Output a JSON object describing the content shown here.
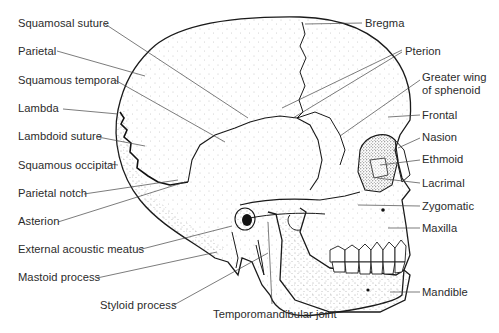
{
  "diagram": {
    "colors": {
      "ink": "#1a1a1a",
      "text": "#2b2b2b",
      "leader": "#444444",
      "background": "#ffffff"
    },
    "labels_left": [
      {
        "id": "squamosal-suture",
        "text": "Squamosal suture",
        "x": 18,
        "y": 17
      },
      {
        "id": "parietal",
        "text": "Parietal",
        "x": 18,
        "y": 45
      },
      {
        "id": "squamous-temporal",
        "text": "Squamous temporal",
        "x": 18,
        "y": 74
      },
      {
        "id": "lambda",
        "text": "Lambda",
        "x": 18,
        "y": 102
      },
      {
        "id": "lambdoid-suture",
        "text": "Lambdoid suture",
        "x": 18,
        "y": 130
      },
      {
        "id": "squamous-occipital",
        "text": "Squamous occipital",
        "x": 18,
        "y": 159
      },
      {
        "id": "parietal-notch",
        "text": "Parietal notch",
        "x": 18,
        "y": 187
      },
      {
        "id": "asterion",
        "text": "Asterion",
        "x": 18,
        "y": 215
      },
      {
        "id": "external-acoustic-meatus",
        "text": "External acoustic meatus",
        "x": 18,
        "y": 243
      },
      {
        "id": "mastoid-process",
        "text": "Mastoid process",
        "x": 18,
        "y": 271
      },
      {
        "id": "styloid-process",
        "text": "Styloid process",
        "x": 100,
        "y": 299
      }
    ],
    "labels_bottom": [
      {
        "id": "temporomandibular-joint",
        "text": "Temporomandibular joint",
        "x": 213,
        "y": 308
      }
    ],
    "labels_right": [
      {
        "id": "bregma",
        "text": "Bregma",
        "x": 365,
        "y": 17
      },
      {
        "id": "pterion",
        "text": "Pterion",
        "x": 405,
        "y": 45
      },
      {
        "id": "greater-wing-of-sphenoid-line1",
        "text": "Greater wing",
        "x": 422,
        "y": 71
      },
      {
        "id": "greater-wing-of-sphenoid-line2",
        "text": "of sphenoid",
        "x": 422,
        "y": 84
      },
      {
        "id": "frontal",
        "text": "Frontal",
        "x": 422,
        "y": 109
      },
      {
        "id": "nasion",
        "text": "Nasion",
        "x": 422,
        "y": 131
      },
      {
        "id": "ethmoid",
        "text": "Ethmoid",
        "x": 422,
        "y": 153
      },
      {
        "id": "lacrimal",
        "text": "Lacrimal",
        "x": 422,
        "y": 177
      },
      {
        "id": "zygomatic",
        "text": "Zygomatic",
        "x": 422,
        "y": 200
      },
      {
        "id": "maxilla",
        "text": "Maxilla",
        "x": 422,
        "y": 222
      },
      {
        "id": "mandible",
        "text": "Mandible",
        "x": 422,
        "y": 286
      }
    ]
  }
}
